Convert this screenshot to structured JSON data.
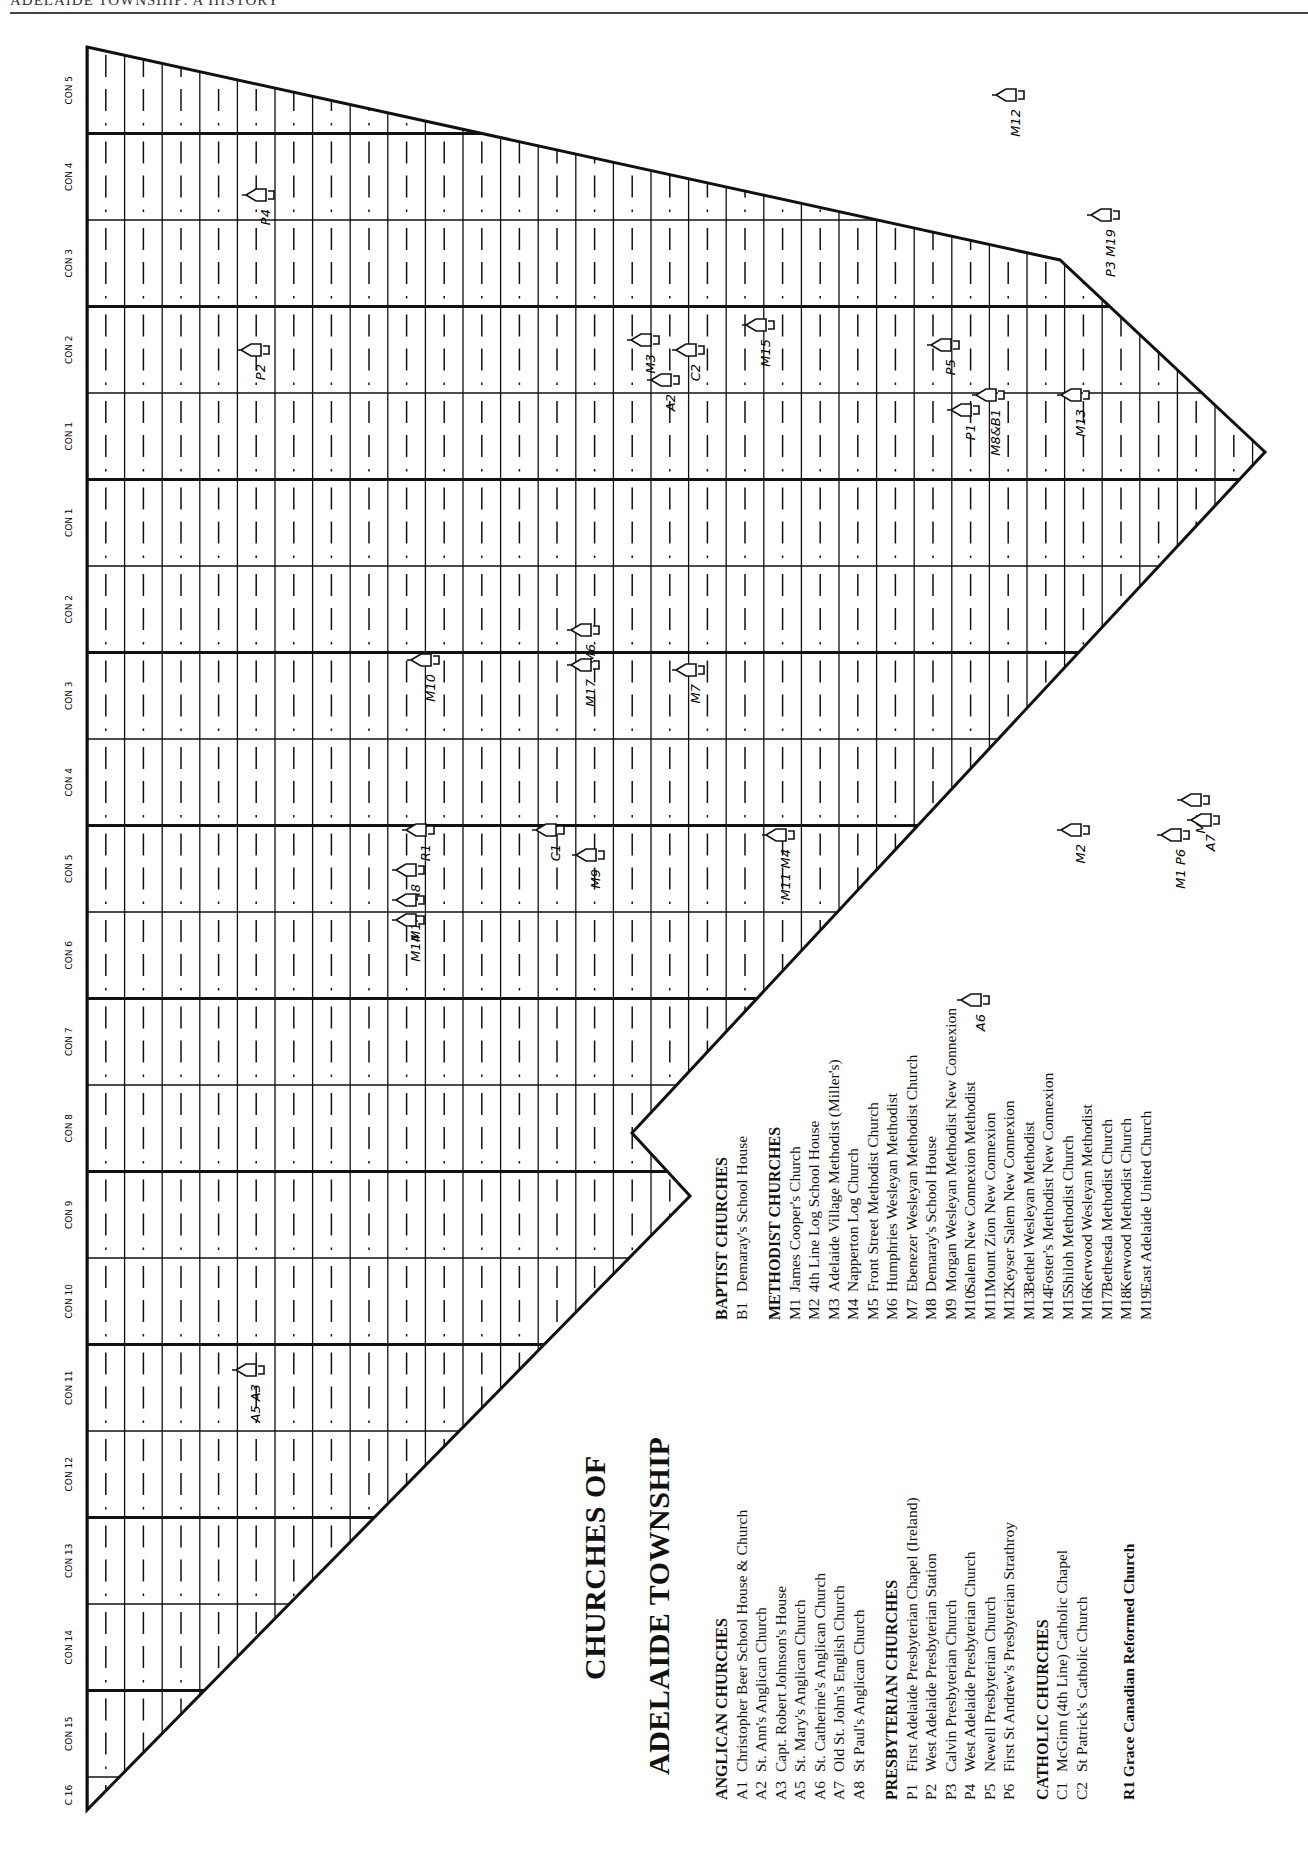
{
  "page_header": "ADELAIDE TOWNSHIP: A HISTORY",
  "map": {
    "title_line1": "CHURCHES OF",
    "title_line2": "ADELAIDE TOWNSHIP",
    "concessions": [
      "CON 5",
      "CON 4",
      "CON 3",
      "CON 2",
      "CON 1",
      "CON 1",
      "CON 2",
      "CON 3",
      "CON 4",
      "CON 5",
      "CON 6",
      "CON 7",
      "CON 8",
      "CON 9",
      "CON 10",
      "CON 11",
      "CON 12",
      "CON 13",
      "CON 14",
      "CON 15",
      "C 16"
    ],
    "lot_numbers": [
      "1",
      "2",
      "3",
      "4",
      "5",
      "6",
      "7",
      "8",
      "9",
      "10",
      "11",
      "12",
      "13",
      "14",
      "15",
      "16",
      "17",
      "18",
      "19",
      "20",
      "21",
      "22",
      "23",
      "24",
      "25",
      "26",
      "27",
      "28",
      "29",
      "30",
      "31"
    ],
    "church_markers": [
      {
        "label": "M12",
        "x": 1010,
        "y": 95
      },
      {
        "label": "P4",
        "x": 260,
        "y": 195
      },
      {
        "label": "P3 M19",
        "x": 1105,
        "y": 215
      },
      {
        "label": "M15",
        "x": 760,
        "y": 325
      },
      {
        "label": "P2",
        "x": 255,
        "y": 350
      },
      {
        "label": "M3",
        "x": 645,
        "y": 340
      },
      {
        "label": "C2",
        "x": 690,
        "y": 350
      },
      {
        "label": "A2",
        "x": 665,
        "y": 380
      },
      {
        "label": "P5",
        "x": 945,
        "y": 345
      },
      {
        "label": "M8&B1",
        "x": 990,
        "y": 395
      },
      {
        "label": "P1",
        "x": 965,
        "y": 410
      },
      {
        "label": "M13",
        "x": 1075,
        "y": 395
      },
      {
        "label": "M10",
        "x": 425,
        "y": 660
      },
      {
        "label": "M6",
        "x": 585,
        "y": 630
      },
      {
        "label": "M17",
        "x": 585,
        "y": 665
      },
      {
        "label": "M7",
        "x": 690,
        "y": 670
      },
      {
        "label": "R1",
        "x": 420,
        "y": 830
      },
      {
        "label": "A8",
        "x": 410,
        "y": 870
      },
      {
        "label": "M18",
        "x": 410,
        "y": 900
      },
      {
        "label": "M14",
        "x": 410,
        "y": 920
      },
      {
        "label": "C1",
        "x": 550,
        "y": 830
      },
      {
        "label": "M9",
        "x": 590,
        "y": 855
      },
      {
        "label": "M11 M4",
        "x": 780,
        "y": 835
      },
      {
        "label": "M2",
        "x": 1075,
        "y": 830
      },
      {
        "label": "M1 P6",
        "x": 1175,
        "y": 835
      },
      {
        "label": "M5",
        "x": 1195,
        "y": 800
      },
      {
        "label": "A7",
        "x": 1205,
        "y": 820
      },
      {
        "label": "A6",
        "x": 975,
        "y": 1000
      },
      {
        "label": "A5 A3",
        "x": 250,
        "y": 1370
      }
    ]
  },
  "legend": {
    "anglican": {
      "heading": "ANGLICAN CHURCHES",
      "items": [
        {
          "code": "A1",
          "name": "Christopher Beer School House & Church"
        },
        {
          "code": "A2",
          "name": "St. Ann's Anglican Church"
        },
        {
          "code": "A3",
          "name": "Capt. Robert Johnson's House"
        },
        {
          "code": "A5",
          "name": "St. Mary's Anglican Church"
        },
        {
          "code": "A6",
          "name": "St. Catherine's Anglican Church"
        },
        {
          "code": "A7",
          "name": "Old St. John's English Church"
        },
        {
          "code": "A8",
          "name": "St Paul's Anglican Church"
        }
      ]
    },
    "presbyterian": {
      "heading": "PRESBYTERIAN CHURCHES",
      "items": [
        {
          "code": "P1",
          "name": "First Adelaide Presbyterian Chapel (Ireland)"
        },
        {
          "code": "P2",
          "name": "West Adelaide Presbyterian Station"
        },
        {
          "code": "P3",
          "name": "Calvin Presbyterian Church"
        },
        {
          "code": "P4",
          "name": "West Adelaide Presbyterian Church"
        },
        {
          "code": "P5",
          "name": "Newell Presbyterian Church"
        },
        {
          "code": "P6",
          "name": "First St Andrew's Presbyterian Strathroy"
        }
      ]
    },
    "catholic": {
      "heading": "CATHOLIC CHURCHES",
      "items": [
        {
          "code": "C1",
          "name": "McGinn (4th Line) Catholic Chapel"
        },
        {
          "code": "C2",
          "name": "St Patrick's Catholic Church"
        }
      ]
    },
    "reformed": {
      "code": "R1",
      "name": "Grace Canadian Reformed Church"
    },
    "baptist": {
      "heading": "BAPTIST CHURCHES",
      "items": [
        {
          "code": "B1",
          "name": "Demaray's School House"
        }
      ]
    },
    "methodist": {
      "heading": "METHODIST CHURCHES",
      "items": [
        {
          "code": "M1",
          "name": "James Cooper's Church"
        },
        {
          "code": "M2",
          "name": "4th Line Log School House"
        },
        {
          "code": "M3",
          "name": "Adelaide Village Methodist (Miller's)"
        },
        {
          "code": "M4",
          "name": "Napperton Log Church"
        },
        {
          "code": "M5",
          "name": "Front  Street Methodist Church"
        },
        {
          "code": "M6",
          "name": "Humphries Wesleyan Methodist"
        },
        {
          "code": "M7",
          "name": "Ebenezer Wesleyan Methodist Church"
        },
        {
          "code": "M8",
          "name": "Demaray's  School House"
        },
        {
          "code": "M9",
          "name": "Morgan Wesleyan Methodist New Connexion"
        },
        {
          "code": "M10",
          "name": "Salem New Connexion Methodist"
        },
        {
          "code": "M11",
          "name": "Mount Zion New Connexion"
        },
        {
          "code": "M12",
          "name": "Keyser  Salem New Connexion"
        },
        {
          "code": "M13",
          "name": "Bethel Wesleyan Methodist"
        },
        {
          "code": "M14",
          "name": "Foster's Methodist New Connexion"
        },
        {
          "code": "M15",
          "name": "Shiloh Methodist Church"
        },
        {
          "code": "M16",
          "name": "Kerwood Wesleyan Methodist"
        },
        {
          "code": "M17",
          "name": "Bethesda Methodist Church"
        },
        {
          "code": "M18",
          "name": "Kerwood Methodist Church"
        },
        {
          "code": "M19",
          "name": "East Adelaide United Church"
        }
      ]
    }
  }
}
